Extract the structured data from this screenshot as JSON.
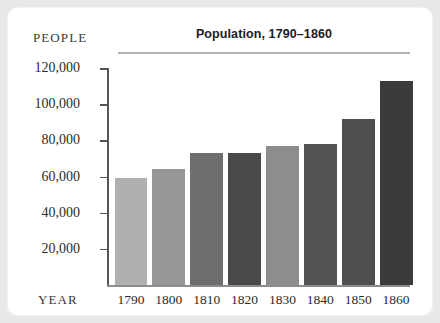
{
  "chart_data": {
    "type": "bar",
    "title": "Population, 1790–1860",
    "xlabel": "YEAR",
    "ylabel": "PEOPLE",
    "categories": [
      "1790",
      "1800",
      "1810",
      "1820",
      "1830",
      "1840",
      "1850",
      "1860"
    ],
    "values": [
      59000,
      64000,
      73000,
      73000,
      77000,
      78000,
      92000,
      113000
    ],
    "ylim": [
      0,
      120000
    ],
    "ytick_labels": [
      "20,000",
      "40,000",
      "60,000",
      "80,000",
      "100,000",
      "120,000"
    ],
    "ytick_values": [
      20000,
      40000,
      60000,
      80000,
      100000,
      120000
    ],
    "grid": false,
    "legend": false,
    "bar_colors": [
      "#b0b0b0",
      "#969696",
      "#6e6e6e",
      "#4a4a4a",
      "#8d8d8d",
      "#545454",
      "#4f4f4f",
      "#3b3b3b"
    ]
  },
  "figure": {
    "title": "Population, 1790–1860",
    "y_axis_caption": "PEOPLE",
    "x_axis_caption": "YEAR"
  }
}
